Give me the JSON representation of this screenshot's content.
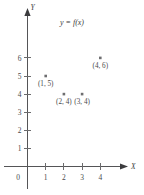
{
  "figure": {
    "title": "y = f(x)",
    "background_color": "#ffffff",
    "axis_color": "#555557",
    "point_color": "#6e6e70",
    "label_color": "#4a4a4c",
    "origin_label": "0",
    "x_axis_name": "X",
    "y_axis_name": "Y"
  },
  "chart_data": {
    "type": "scatter",
    "title": "y = f(x)",
    "xlabel": "X",
    "ylabel": "Y",
    "xlim": [
      0,
      5
    ],
    "ylim": [
      0,
      7
    ],
    "grid": false,
    "legend": "none",
    "x_ticks": [
      "1",
      "2",
      "3",
      "4"
    ],
    "x_tick_values": [
      1,
      2,
      3,
      4
    ],
    "y_ticks": [
      "1",
      "2",
      "3",
      "4",
      "5",
      "6"
    ],
    "y_tick_values": [
      1,
      2,
      3,
      4,
      5,
      6
    ],
    "points": [
      {
        "x": 1,
        "y": 5,
        "label": "(1, 5)"
      },
      {
        "x": 2,
        "y": 4,
        "label": "(2, 4)"
      },
      {
        "x": 3,
        "y": 4,
        "label": "(3, 4)"
      },
      {
        "x": 4,
        "y": 6,
        "label": "(4, 6)"
      }
    ]
  }
}
